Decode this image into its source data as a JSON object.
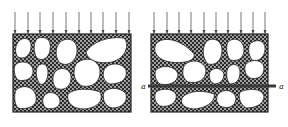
{
  "diagram": {
    "type": "granular-specimen-load-diagram",
    "panels": [
      {
        "id": "left",
        "description": "granular mass with matrix between grains under distributed vertical load",
        "load_arrows": 10,
        "section_line": null
      },
      {
        "id": "right",
        "description": "granular mass under distributed vertical load with horizontal section plane",
        "load_arrows": 10,
        "section_line": {
          "label_left": "a",
          "label_right": "a"
        }
      }
    ],
    "colors": {
      "outline": "#222222",
      "matrix": "#333333",
      "grain": "#ffffff",
      "arrow": "#555555",
      "section_line": "#3a3a3a"
    }
  }
}
